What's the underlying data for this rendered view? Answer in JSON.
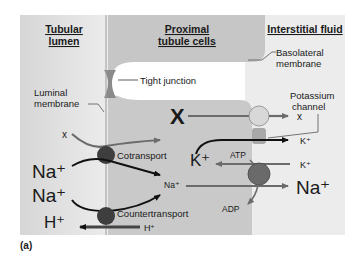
{
  "regions": {
    "lumen": "Tubular lumen",
    "lumen_line1": "Tubular",
    "lumen_line2": "lumen",
    "cells_line1": "Proximal",
    "cells_line2": "tubule cells",
    "interstitial": "Interstitial fluid"
  },
  "labels": {
    "basolateral_line1": "Basolateral",
    "basolateral_line2": "membrane",
    "tight_junction": "Tight junction",
    "luminal_line1": "Luminal",
    "luminal_line2": "membrane",
    "potassium_line1": "Potassium",
    "potassium_line2": "channel",
    "cotransport": "Cotransport",
    "countertransport": "Countertransport",
    "atp": "ATP",
    "adp": "ADP"
  },
  "solutes": {
    "x_lumen": "x",
    "x_cell": "X",
    "x_interstitial": "x",
    "na_lumen_1": "Na⁺",
    "na_lumen_2": "Na⁺",
    "na_cell": "Na⁺",
    "na_interstitial": "Na⁺",
    "h_lumen": "H⁺",
    "h_cell": "H⁺",
    "k_cell": "K⁺",
    "k_interstitial_out": "K⁺",
    "k_interstitial_in": "K⁺"
  },
  "caption": "(a)",
  "colors": {
    "lumen_bg": "#e4e4e4",
    "cell_bg": "#c9c9c9",
    "interstitial_bg": "#ececec",
    "transporter_dark": "#3e3e3e",
    "pump": "#6a6a6a",
    "carrier_light": "#d8d8d8",
    "arrow_gray": "#6b6b6b",
    "arrow_black": "#111111"
  }
}
